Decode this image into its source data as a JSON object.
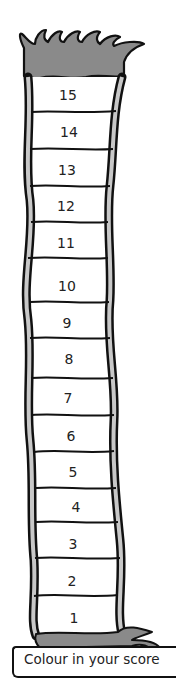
{
  "rungs": [
    "15",
    "14",
    "13",
    "12",
    "11",
    "10",
    "9",
    "8",
    "7",
    "6",
    "5",
    "4",
    "3",
    "2",
    "1"
  ],
  "label": "Colour in your score",
  "colors": {
    "grass": "#8a8a8a",
    "outline": "#111111",
    "rail": "#c8c8c8",
    "cell": "#ffffff",
    "text": "#222222"
  }
}
